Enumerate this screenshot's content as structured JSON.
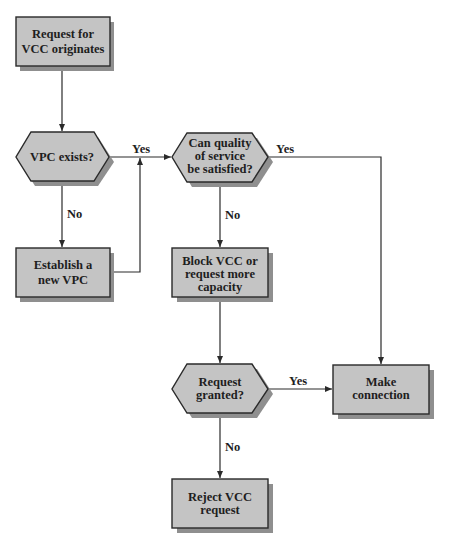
{
  "diagram": {
    "type": "flowchart",
    "colors": {
      "node_fill": "#c4c4c4",
      "node_stroke": "#2a2a2a",
      "shadow": "#8f8f8f",
      "line": "#2a2a2a",
      "background": "#ffffff"
    },
    "nodes": [
      {
        "id": "start",
        "shape": "rect",
        "lines": [
          "Request for",
          "VCC originates"
        ]
      },
      {
        "id": "vpc_exists",
        "shape": "hexagon",
        "lines": [
          "VPC exists?"
        ]
      },
      {
        "id": "qos",
        "shape": "hexagon",
        "lines": [
          "Can quality",
          "of service",
          "be satisfied?"
        ]
      },
      {
        "id": "establish",
        "shape": "rect",
        "lines": [
          "Establish a",
          "new VPC"
        ]
      },
      {
        "id": "block",
        "shape": "rect",
        "lines": [
          "Block VCC or",
          "request more",
          "capacity"
        ]
      },
      {
        "id": "granted",
        "shape": "hexagon",
        "lines": [
          "Request",
          "granted?"
        ]
      },
      {
        "id": "make",
        "shape": "rect",
        "lines": [
          "Make",
          "connection"
        ]
      },
      {
        "id": "reject",
        "shape": "rect",
        "lines": [
          "Reject VCC",
          "request"
        ]
      }
    ],
    "edges": [
      {
        "from": "start",
        "to": "vpc_exists",
        "label": ""
      },
      {
        "from": "vpc_exists",
        "to": "qos",
        "label": "Yes"
      },
      {
        "from": "vpc_exists",
        "to": "establish",
        "label": "No"
      },
      {
        "from": "establish",
        "to": "qos",
        "label": ""
      },
      {
        "from": "qos",
        "to": "make",
        "label": "Yes"
      },
      {
        "from": "qos",
        "to": "block",
        "label": "No"
      },
      {
        "from": "block",
        "to": "granted",
        "label": ""
      },
      {
        "from": "granted",
        "to": "make",
        "label": "Yes"
      },
      {
        "from": "granted",
        "to": "reject",
        "label": "No"
      }
    ],
    "labels": {
      "vpc_yes": "Yes",
      "vpc_no": "No",
      "qos_yes": "Yes",
      "qos_no": "No",
      "granted_yes": "Yes",
      "granted_no": "No"
    }
  }
}
